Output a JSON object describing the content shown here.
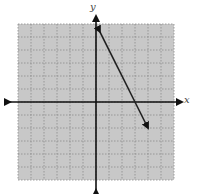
{
  "chart_data": {
    "type": "line",
    "title": "",
    "xlabel": "x",
    "ylabel": "y",
    "xlim": [
      -6,
      6
    ],
    "ylim": [
      -6,
      6
    ],
    "grid": true,
    "grid_style": "dotted",
    "background": "#c8c8c8",
    "tick_labels": false,
    "series": [
      {
        "name": "line",
        "equation": "y = -2x + 6",
        "slope": -2,
        "y_intercept": 6,
        "x_intercept": 3,
        "x": [
          0.3,
          4
        ],
        "y": [
          5.4,
          -2
        ],
        "arrows": "both",
        "color": "#222222"
      }
    ]
  },
  "labels": {
    "x_axis": "x",
    "y_axis": "y"
  }
}
